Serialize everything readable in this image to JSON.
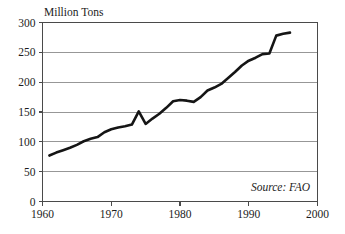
{
  "chart_data": {
    "type": "line",
    "title": "",
    "subtitle": "",
    "ylabel": "Million Tons",
    "xlabel": "",
    "annotation": "Source: FAO",
    "grid": "horizontal",
    "legend_position": "none",
    "xlim": [
      1960,
      2000
    ],
    "ylim": [
      0,
      300
    ],
    "yticks": [
      0,
      50,
      100,
      150,
      200,
      250,
      300
    ],
    "xticks": [
      1960,
      1970,
      1980,
      1990,
      2000
    ],
    "ytick_labels": [
      "0",
      "50",
      "100",
      "150",
      "200",
      "250",
      "300"
    ],
    "xtick_labels": [
      "1960",
      "1970",
      "1980",
      "1990",
      "2000"
    ],
    "line_color": "#151515",
    "grid_color": "#8c8c8c",
    "x": [
      1961,
      1962,
      1963,
      1964,
      1965,
      1966,
      1967,
      1968,
      1969,
      1970,
      1971,
      1972,
      1973,
      1974,
      1975,
      1976,
      1977,
      1978,
      1979,
      1980,
      1981,
      1982,
      1983,
      1984,
      1985,
      1986,
      1987,
      1988,
      1989,
      1990,
      1991,
      1992,
      1993,
      1994,
      1995,
      1996
    ],
    "values": [
      77,
      82,
      86,
      90,
      95,
      101,
      105,
      108,
      116,
      121,
      124,
      126,
      129,
      151,
      130,
      139,
      147,
      157,
      168,
      170,
      169,
      167,
      175,
      186,
      191,
      197,
      207,
      217,
      228,
      236,
      241,
      247,
      248,
      278,
      281,
      283
    ],
    "y": [
      77,
      82,
      86,
      90,
      95,
      101,
      105,
      108,
      116,
      121,
      124,
      126,
      129,
      151,
      130,
      139,
      147,
      157,
      168,
      170,
      169,
      167,
      175,
      186,
      191,
      197,
      207,
      217,
      228,
      236,
      241,
      247,
      248,
      278,
      281,
      283
    ],
    "series": [
      {
        "name": "Million Tons",
        "values": [
          77,
          82,
          86,
          90,
          95,
          101,
          105,
          108,
          116,
          121,
          124,
          126,
          129,
          151,
          130,
          139,
          147,
          157,
          168,
          170,
          169,
          167,
          175,
          186,
          191,
          197,
          207,
          217,
          228,
          236,
          241,
          247,
          248,
          278,
          281,
          283
        ]
      }
    ]
  },
  "labels": {
    "y_axis_title": "Million Tons",
    "source": "Source: FAO"
  }
}
